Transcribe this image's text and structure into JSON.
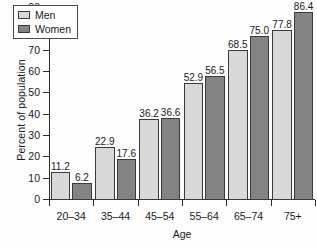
{
  "chart_data": {
    "type": "bar",
    "title": "",
    "xlabel": "Age",
    "ylabel": "Percent of population",
    "categories": [
      "20–34",
      "35–44",
      "45–54",
      "55–64",
      "65–74",
      "75+"
    ],
    "series": [
      {
        "name": "Men",
        "color": "#d9d9d9",
        "values": [
          11.2,
          22.9,
          36.2,
          52.9,
          68.5,
          77.8
        ],
        "labels": [
          "11.2",
          "22.9",
          "36.2",
          "52.9",
          "68.5",
          "77.8"
        ]
      },
      {
        "name": "Women",
        "color": "#838383",
        "values": [
          6.2,
          17.6,
          36.6,
          56.5,
          75.0,
          86.4
        ],
        "labels": [
          "6.2",
          "17.6",
          "36.6",
          "56.5",
          "75.0",
          "86.4"
        ]
      }
    ],
    "ylim": [
      0,
      90
    ],
    "yticks": [
      0,
      10,
      20,
      30,
      40,
      50,
      60,
      70,
      80,
      90
    ],
    "ytick_labels": [
      "0",
      "10",
      "20",
      "30",
      "40",
      "50",
      "60",
      "70",
      "80",
      "90"
    ],
    "grid": false,
    "legend_position": "upper left"
  }
}
